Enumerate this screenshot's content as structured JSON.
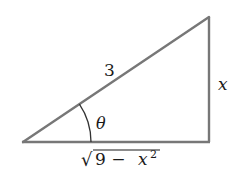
{
  "diagram": {
    "type": "right-triangle",
    "vertices": {
      "left": [
        23,
        142
      ],
      "right_angle": [
        209,
        142
      ],
      "top": [
        209,
        17
      ]
    },
    "line_color": "#777777",
    "labels": {
      "hypotenuse": "3",
      "opposite": "x",
      "angle": "θ",
      "adjacent_radicand_base": "9 − ",
      "adjacent_var": "x",
      "adjacent_exp": "2",
      "radical_sign": "√"
    }
  }
}
